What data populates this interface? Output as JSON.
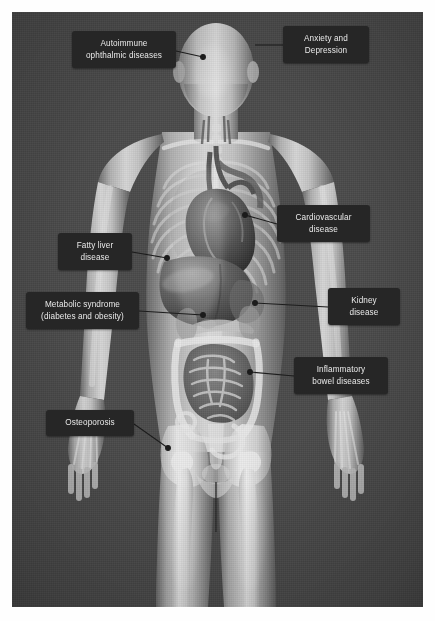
{
  "figure": {
    "background_color": "#4b4b4b",
    "label_box_color": "#262626",
    "label_text_color": "#e9e9e9",
    "connector_color": "#1c1c1c"
  },
  "labels": [
    {
      "id": "autoimmune-ophthalmic",
      "text": "Autoimmune\nophthalmic diseases",
      "x": 72,
      "y": 31,
      "w": 104,
      "h": 37,
      "organ": "eye"
    },
    {
      "id": "anxiety-depression",
      "text": "Anxiety and\nDepression",
      "x": 283,
      "y": 26,
      "w": 86,
      "h": 37,
      "organ": "brain"
    },
    {
      "id": "cardiovascular",
      "text": "Cardiovascular\ndisease",
      "x": 277,
      "y": 205,
      "w": 93,
      "h": 37,
      "organ": "heart"
    },
    {
      "id": "fatty-liver",
      "text": "Fatty liver\ndisease",
      "x": 58,
      "y": 233,
      "w": 74,
      "h": 37,
      "organ": "liver"
    },
    {
      "id": "metabolic-syndrome",
      "text": "Metabolic syndrome\n(diabetes and obesity)",
      "x": 26,
      "y": 292,
      "w": 113,
      "h": 37,
      "organ": "pancreas"
    },
    {
      "id": "kidney-disease",
      "text": "Kidney\ndisease",
      "x": 328,
      "y": 288,
      "w": 72,
      "h": 37,
      "organ": "kidney"
    },
    {
      "id": "inflammatory-bowel",
      "text": "Inflammatory\nbowel diseases",
      "x": 294,
      "y": 357,
      "w": 94,
      "h": 37,
      "organ": "intestines"
    },
    {
      "id": "osteoporosis",
      "text": "Osteoporosis",
      "x": 46,
      "y": 410,
      "w": 88,
      "h": 26,
      "organ": "hip-bone"
    }
  ],
  "connectors": [
    {
      "id": "connector-autoimmune-ophthalmic",
      "from": [
        176,
        51
      ],
      "to": [
        203,
        57
      ],
      "dot": [
        203,
        57
      ]
    },
    {
      "id": "connector-anxiety-depression",
      "from": [
        283,
        45
      ],
      "to": [
        255,
        45
      ],
      "dot": null
    },
    {
      "id": "connector-cardiovascular",
      "from": [
        277,
        224
      ],
      "to": [
        245,
        215
      ],
      "dot": [
        245,
        215
      ]
    },
    {
      "id": "connector-fatty-liver",
      "from": [
        132,
        252
      ],
      "to": [
        167,
        258
      ],
      "dot": [
        167,
        258
      ]
    },
    {
      "id": "connector-metabolic-syndrome",
      "from": [
        139,
        311
      ],
      "to": [
        203,
        315
      ],
      "dot": [
        203,
        315
      ]
    },
    {
      "id": "connector-kidney-disease",
      "from": [
        328,
        307
      ],
      "to": [
        255,
        303
      ],
      "dot": [
        255,
        303
      ]
    },
    {
      "id": "connector-inflammatory-bowel",
      "from": [
        294,
        376
      ],
      "to": [
        250,
        372
      ],
      "dot": [
        250,
        372
      ]
    },
    {
      "id": "connector-osteoporosis",
      "from": [
        134,
        424
      ],
      "to": [
        168,
        448
      ],
      "dot": [
        168,
        448
      ]
    }
  ]
}
